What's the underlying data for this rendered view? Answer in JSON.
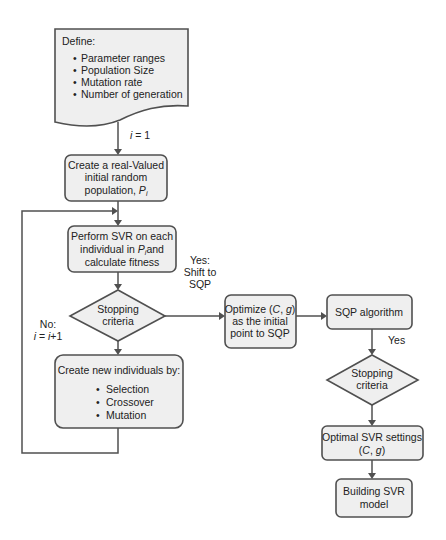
{
  "diagram": {
    "type": "flowchart",
    "colors": {
      "fill": "#efefef",
      "stroke": "#505050",
      "text": "#222222"
    },
    "nodes": {
      "define": {
        "title": "Define:",
        "items": [
          "Parameter ranges",
          "Population Size",
          "Mutation rate",
          "Number of generation"
        ]
      },
      "init_population": {
        "lines": [
          "Create a real-Valued",
          "initial random",
          "population, "
        ],
        "var": "P",
        "sub": "i"
      },
      "perform_svr": {
        "lines": [
          "Perform SVR on each",
          "individual in ",
          "and",
          "calculate fitness"
        ],
        "var": "P",
        "sub": "i"
      },
      "stop1": {
        "lines": [
          "Stopping",
          "criteria"
        ]
      },
      "new_individuals": {
        "title": "Create new individuals by:",
        "items": [
          "Selection",
          "Crossover",
          "Mutation"
        ]
      },
      "optimize": {
        "line1_a": "Optimize (",
        "C": "C",
        "comma": ", ",
        "g": "g",
        "line1_b": ")",
        "line2": "as the initial",
        "line3": "point to SQP"
      },
      "sqp": {
        "label": "SQP algorithm"
      },
      "stop2": {
        "lines": [
          "Stopping",
          "criteria"
        ]
      },
      "optimal": {
        "line1": "Optimal SVR settings",
        "p1": "(",
        "C": "C",
        "comma": ", ",
        "g": "g",
        "p2": ")"
      },
      "build": {
        "lines": [
          "Building SVR",
          "model"
        ]
      }
    },
    "edge_labels": {
      "i_eq_1": {
        "var": "i",
        "rest": " = 1"
      },
      "yes_shift": [
        "Yes:",
        "Shift to",
        "SQP"
      ],
      "no": {
        "line1": "No:",
        "var1": "i",
        "mid": " = ",
        "var2": "i",
        "rest": "+1"
      },
      "yes2": "Yes"
    },
    "bullet": "•"
  }
}
